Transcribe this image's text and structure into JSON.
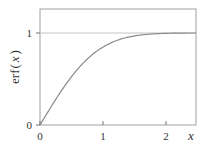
{
  "chart_data": {
    "type": "line",
    "title": "",
    "xlabel": "x",
    "ylabel": "erf(x)",
    "xlim": [
      0,
      2.5
    ],
    "ylim": [
      0,
      1.26
    ],
    "x_ticks": [
      0,
      1,
      2
    ],
    "x_tick_labels": [
      "0",
      "1",
      "2"
    ],
    "y_ticks": [
      0,
      1
    ],
    "y_tick_labels": [
      "0",
      "1"
    ],
    "grid": false,
    "reference_lines": [
      {
        "axis": "y",
        "value": 1
      }
    ],
    "series": [
      {
        "name": "erf(x)",
        "function": "erf",
        "x": [
          0,
          0.25,
          0.5,
          0.75,
          1.0,
          1.25,
          1.5,
          1.75,
          2.0,
          2.25,
          2.5
        ],
        "values": [
          0,
          0.276,
          0.52,
          0.711,
          0.843,
          0.923,
          0.966,
          0.987,
          0.995,
          0.999,
          1.0
        ]
      }
    ],
    "colors": {
      "curve": "#888888",
      "frame": "#999999",
      "reference": "#bbbbbb"
    }
  },
  "labels": {
    "ylabel_fn": "erf",
    "ylabel_open": "(",
    "ylabel_var": "x",
    "ylabel_close": ")",
    "xlabel": "x",
    "xtick_0": "0",
    "xtick_1": "1",
    "xtick_2": "2",
    "ytick_0": "0",
    "ytick_1": "1"
  }
}
